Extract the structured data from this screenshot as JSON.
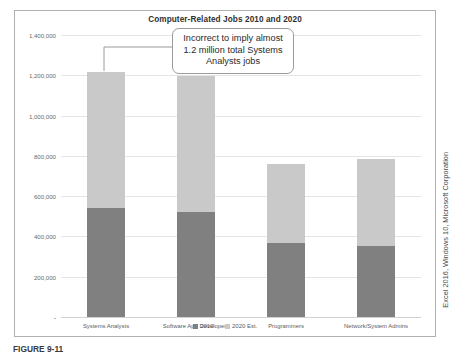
{
  "chart_data": {
    "type": "bar",
    "subtype": "stacked-column",
    "title": "Computer-Related Jobs 2010 and 2020",
    "xlabel": "",
    "ylabel": "",
    "ylim": [
      0,
      1400000
    ],
    "ytick_values": [
      1400000,
      1200000,
      1000000,
      800000,
      600000,
      400000,
      200000,
      0
    ],
    "ytick_labels": [
      "1,400,000",
      "1,200,000",
      "1,000,000",
      "800,000",
      "600,000",
      "400,000",
      "200,000",
      "-"
    ],
    "grid": true,
    "legend_position": "bottom",
    "categories": [
      "Systems Analysts",
      "Software App Developers",
      "Programmers",
      "Network/System Admins"
    ],
    "series": [
      {
        "name": "2010",
        "color": "#808080",
        "values": [
          540000,
          520000,
          365000,
          355000
        ]
      },
      {
        "name": "2020 Est.",
        "color": "#c9c9c9",
        "values": [
          675000,
          675000,
          395000,
          430000
        ]
      }
    ],
    "stack_totals": [
      1215000,
      1195000,
      760000,
      785000
    ],
    "annotations": [
      {
        "name": "systems-analysts-callout",
        "lines": [
          "Incorrect to imply almost",
          "1.2 million total Systems",
          "Analysts jobs"
        ],
        "points_to": "Systems Analysts"
      }
    ]
  },
  "legend": {
    "items": [
      {
        "label": "2010",
        "color": "#808080"
      },
      {
        "label": "2020 Est.",
        "color": "#c9c9c9"
      }
    ]
  },
  "attribution": {
    "text": "Excel 2016, Windows 10, Microsoft Corporation"
  },
  "caption": {
    "text": "FIGURE 9-11"
  }
}
